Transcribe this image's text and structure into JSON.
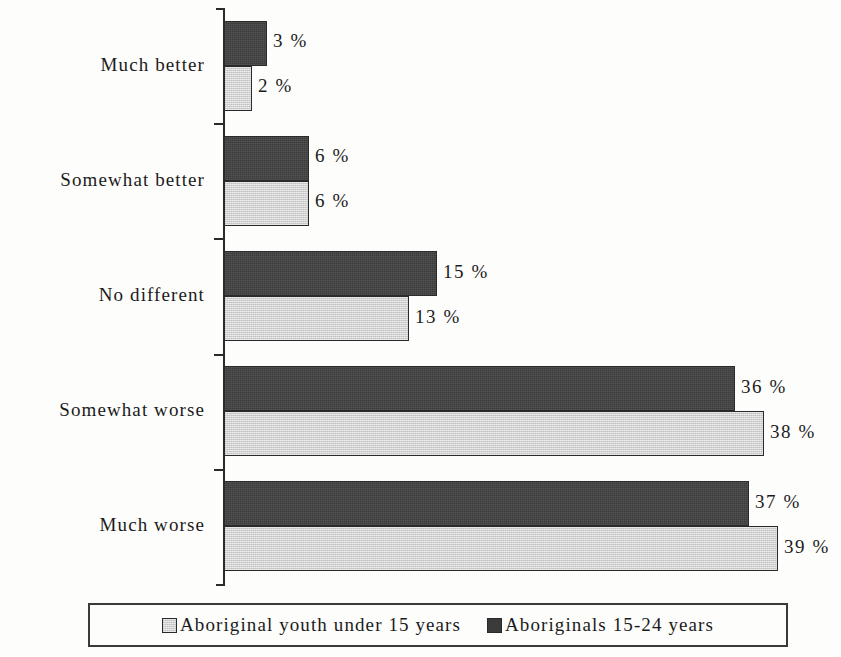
{
  "chart_data": {
    "type": "bar",
    "orientation": "horizontal",
    "grouped": true,
    "title": "",
    "subtitle": "",
    "xlabel": "",
    "ylabel": "",
    "xlim": [
      0,
      40
    ],
    "grid": false,
    "legend_position": "bottom",
    "categories": [
      "Much better",
      "Somewhat better",
      "No different",
      "Somewhat worse",
      "Much worse"
    ],
    "series": [
      {
        "name": "Aboriginals 15-24 years",
        "color": "#3b3b3b",
        "values": [
          3,
          6,
          15,
          36,
          37
        ],
        "labels": [
          "3 %",
          "6 %",
          "15 %",
          "36 %",
          "37 %"
        ]
      },
      {
        "name": "Aboriginal youth under 15 years",
        "color": "#d2d2d2",
        "values": [
          2,
          6,
          13,
          38,
          39
        ],
        "labels": [
          "2 %",
          "6 %",
          "13 %",
          "38 %",
          "39 %"
        ]
      }
    ]
  },
  "legend": {
    "entries": [
      {
        "label": "Aboriginal youth under 15 years",
        "swatch": "light-swatch-icon"
      },
      {
        "label": "Aboriginals 15-24 years",
        "swatch": "dark-swatch-icon"
      }
    ]
  }
}
